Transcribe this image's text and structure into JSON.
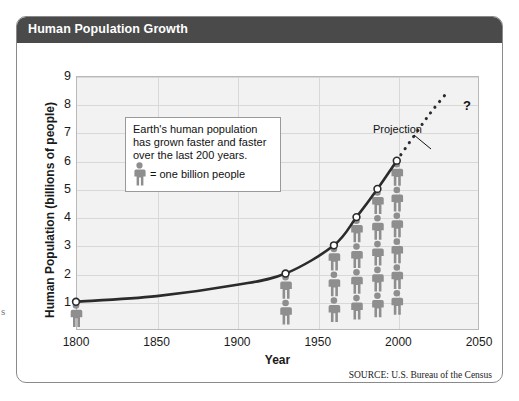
{
  "margin_glyph": "s",
  "figure": {
    "title": "Human Population Growth",
    "source": "SOURCE: U.S. Bureau of the Census",
    "title_bar_color": "#4a4a4a",
    "plot_bg_color": "#f2f2f2",
    "figure_color": "#8e8e8e",
    "curve_color": "#2b2b2b"
  },
  "callout": {
    "line1": "Earth's human population",
    "line2": "has  grown faster and faster",
    "line3": "over the last 200 years.",
    "legend_text": "= one billion people",
    "legend_icon": "person-icon"
  },
  "annotations": {
    "projection_label": "Projection",
    "question_mark": "?"
  },
  "chart_data": {
    "type": "line",
    "title": "Human Population Growth",
    "xlabel": "Year",
    "ylabel": "Human Population (billions of people)",
    "xlim": [
      1800,
      2050
    ],
    "ylim": [
      0,
      9
    ],
    "xticks": [
      1800,
      1850,
      1900,
      1950,
      2000,
      2050
    ],
    "yticks": [
      1,
      2,
      3,
      4,
      5,
      6,
      7,
      8,
      9
    ],
    "grid": true,
    "legend": "inside-callout",
    "series": [
      {
        "name": "Observed population",
        "style": "solid",
        "x": [
          1800,
          1850,
          1900,
          1930,
          1960,
          1974,
          1987,
          1999
        ],
        "y": [
          1.0,
          1.2,
          1.6,
          2.0,
          3.0,
          4.0,
          5.0,
          6.0
        ],
        "markers_x": [
          1800,
          1930,
          1960,
          1974,
          1987,
          1999
        ],
        "markers_y": [
          1,
          2,
          3,
          4,
          5,
          6
        ]
      },
      {
        "name": "Projection",
        "style": "dotted",
        "x": [
          1999,
          2010,
          2020,
          2030
        ],
        "y": [
          6.0,
          6.9,
          7.7,
          8.4
        ]
      }
    ],
    "pictograph": {
      "unit": "one billion people",
      "icon": "person-icon",
      "columns": [
        {
          "year": 1800,
          "count": 1
        },
        {
          "year": 1930,
          "count": 2
        },
        {
          "year": 1960,
          "count": 3
        },
        {
          "year": 1974,
          "count": 4
        },
        {
          "year": 1987,
          "count": 5
        },
        {
          "year": 1999,
          "count": 6
        }
      ]
    }
  }
}
